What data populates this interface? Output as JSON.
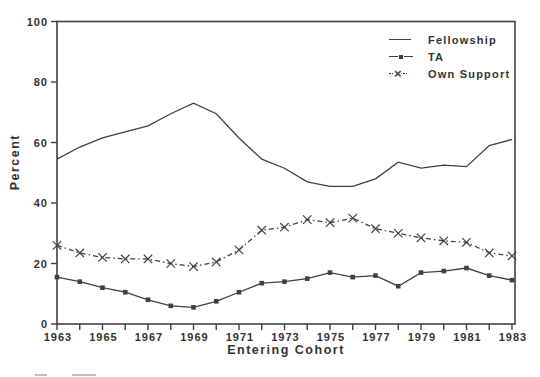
{
  "chart_data": {
    "type": "line",
    "title": "",
    "xlabel": "Entering Cohort",
    "ylabel": "Percent",
    "xlim": [
      1963,
      1983
    ],
    "ylim": [
      0,
      100
    ],
    "yticks": [
      0,
      20,
      40,
      60,
      80,
      100
    ],
    "x": [
      1963,
      1964,
      1965,
      1966,
      1967,
      1968,
      1969,
      1970,
      1971,
      1972,
      1973,
      1974,
      1975,
      1976,
      1977,
      1978,
      1979,
      1980,
      1981,
      1982,
      1983
    ],
    "xtick_label_years": [
      1963,
      1965,
      1967,
      1969,
      1971,
      1973,
      1975,
      1977,
      1979,
      1981,
      1983
    ],
    "grid": false,
    "legend_position": "top-right",
    "background_color": "#ffffff",
    "line_color": "#414141",
    "text_color": "#333333",
    "series": [
      {
        "name": "Fellowship",
        "line_style": "solid",
        "marker": "none",
        "values": [
          54.5,
          58.5,
          61.5,
          63.5,
          65.5,
          69.5,
          73,
          69.5,
          61.5,
          54.5,
          51.5,
          47,
          45.5,
          45.5,
          48,
          53.5,
          51.5,
          52.5,
          52,
          59,
          61
        ]
      },
      {
        "name": "TA",
        "line_style": "solid",
        "marker": "filled-square",
        "values": [
          15.5,
          14,
          12,
          10.5,
          8,
          6,
          5.5,
          7.5,
          10.5,
          13.5,
          14,
          15,
          17,
          15.5,
          16,
          12.5,
          17,
          17.5,
          18.5,
          16,
          14.5
        ]
      },
      {
        "name": "Own Support",
        "line_style": "dash-dot",
        "marker": "x",
        "values": [
          26,
          23.5,
          22,
          21.5,
          21.5,
          20,
          19,
          20.5,
          24.5,
          31,
          32,
          34.5,
          33.5,
          35,
          31.5,
          30,
          28.5,
          27.5,
          27,
          23.5,
          22.5
        ]
      }
    ]
  },
  "icons": {
    "x_marker": "×"
  }
}
